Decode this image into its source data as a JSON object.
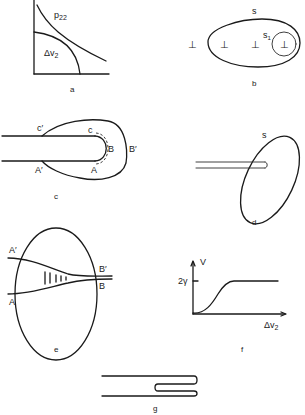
{
  "panels": {
    "a": {
      "caption": "a",
      "curve_upper_label": "p",
      "curve_upper_sub": "22",
      "curve_lower_label": "Δv",
      "curve_lower_sub": "2"
    },
    "b": {
      "caption": "b",
      "surface_label": "s",
      "subsurface_label": "s",
      "subsurface_sub": "1",
      "dislocation_symbol": "⊥"
    },
    "c": {
      "caption": "c",
      "labels": {
        "c_prime": "c′",
        "c": "c",
        "b": "B",
        "b_prime": "B′",
        "a": "A",
        "a_prime": "A′"
      }
    },
    "d": {
      "caption": "d",
      "surface_label": "s"
    },
    "e": {
      "caption": "e",
      "labels": {
        "a_prime": "A′",
        "a": "A",
        "b_prime": "B′",
        "b": "B"
      }
    },
    "f": {
      "caption": "f",
      "y_axis_label": "V",
      "y_tick_label": "2γ",
      "x_axis_label": "Δv",
      "x_axis_sub": "2"
    },
    "g": {
      "caption": "g"
    }
  },
  "colors": {
    "ink": "#1a1a1a",
    "background": "#ffffff"
  }
}
